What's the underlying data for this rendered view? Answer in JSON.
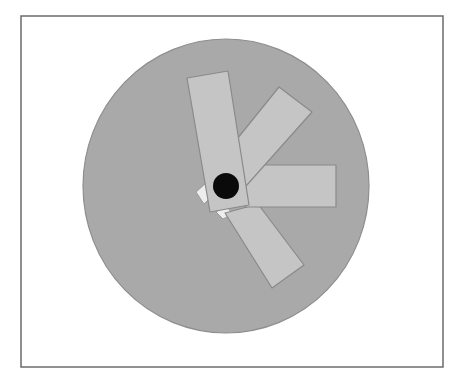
{
  "figure": {
    "frame": {
      "x": 21,
      "y": 16,
      "width": 422,
      "height": 351,
      "stroke": "#6b6b6b"
    },
    "disc": {
      "cx": 226,
      "cy": 186,
      "rx": 143,
      "ry": 147,
      "fill": "#a9a9a9",
      "stroke": "#8e8e8e"
    },
    "blade_style": {
      "fill": "#c5c5c5",
      "stroke": "#8a8a8a"
    },
    "blades": [
      {
        "name": "blade-lower-diagonal",
        "points": "225,213 258,204 304,265 272,288"
      },
      {
        "name": "blade-horizontal-right",
        "points": "245,165 336,165 336,207 245,207"
      },
      {
        "name": "blade-upper-diagonal",
        "points": "238,195 212,170 279,87 312,112"
      },
      {
        "name": "blade-vertical-top",
        "points": "187,78 228,71 249,205 210,212"
      }
    ],
    "chips": [
      {
        "name": "white-chip-left",
        "points": "196,192 206,183 212,196 204,204",
        "fill": "#ededed",
        "stroke": "#9a9a9a"
      },
      {
        "name": "white-chip-bottom",
        "points": "216,212 226,206 233,214 223,219",
        "fill": "#ededed",
        "stroke": "#9a9a9a"
      }
    ],
    "pivot": {
      "cx": 226,
      "cy": 186,
      "r": 13,
      "fill": "#0a0a0a"
    }
  }
}
